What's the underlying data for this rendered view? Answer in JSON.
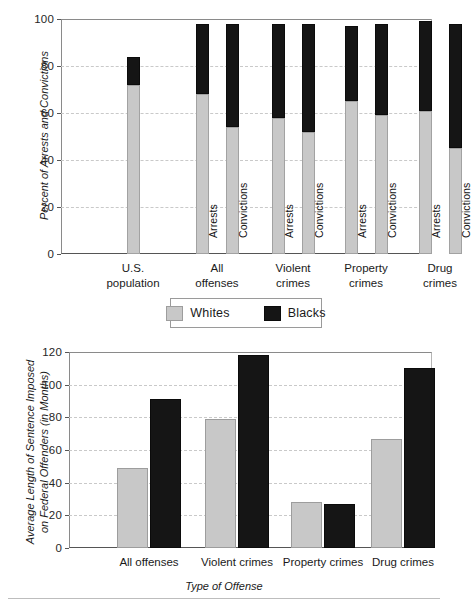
{
  "chart_data": [
    {
      "type": "bar",
      "subtype": "stacked-bar",
      "id": "arrests-convictions",
      "title": "",
      "xlabel": "",
      "ylabel": "Percent of Arrests and Convictions",
      "ylim": [
        0,
        100
      ],
      "yticks": [
        0,
        20,
        40,
        60,
        80,
        100
      ],
      "ytick_labels": [
        "0",
        "20",
        "40",
        "60",
        "80",
        "100"
      ],
      "grid": true,
      "legend": {
        "position": "below",
        "entries": [
          "Whites",
          "Blacks"
        ]
      },
      "series": [
        {
          "name": "Whites",
          "color": "#c8c8c8"
        },
        {
          "name": "Blacks",
          "color": "#151515"
        }
      ],
      "groups": [
        {
          "label": "U.S.\npopulation",
          "bars": [
            {
              "sublabel": "",
              "whites": 72,
              "blacks": 12,
              "total": 84
            }
          ]
        },
        {
          "label": "All\noffenses",
          "bars": [
            {
              "sublabel": "Arrests",
              "whites": 68,
              "blacks": 30,
              "total": 98
            },
            {
              "sublabel": "Convictions",
              "whites": 54,
              "blacks": 44,
              "total": 98
            }
          ]
        },
        {
          "label": "Violent\ncrimes",
          "bars": [
            {
              "sublabel": "Arrests",
              "whites": 58,
              "blacks": 40,
              "total": 98
            },
            {
              "sublabel": "Convictions",
              "whites": 52,
              "blacks": 46,
              "total": 98
            }
          ]
        },
        {
          "label": "Property\ncrimes",
          "bars": [
            {
              "sublabel": "Arrests",
              "whites": 65,
              "blacks": 32,
              "total": 97
            },
            {
              "sublabel": "Convictions",
              "whites": 59,
              "blacks": 39,
              "total": 98
            }
          ]
        },
        {
          "label": "Drug\ncrimes",
          "bars": [
            {
              "sublabel": "Arrests",
              "whites": 61,
              "blacks": 38,
              "total": 99
            },
            {
              "sublabel": "Convictions",
              "whites": 45,
              "blacks": 53,
              "total": 98
            }
          ]
        }
      ]
    },
    {
      "type": "bar",
      "subtype": "grouped-bar",
      "id": "sentence-length",
      "title": "",
      "xlabel": "Type of Offense",
      "ylabel": "Average Length of Sentence Imposed\non Federal Offenders (in Months)",
      "ylabel_line1": "Average Length of Sentence Imposed",
      "ylabel_line2": "on Federal Offenders (in Months)",
      "ylim": [
        0,
        120
      ],
      "yticks": [
        0,
        20,
        40,
        60,
        80,
        100,
        120
      ],
      "ytick_labels": [
        "0",
        "20",
        "40",
        "60",
        "80",
        "100",
        "120"
      ],
      "grid": true,
      "categories": [
        "All offenses",
        "Violent crimes",
        "Property crimes",
        "Drug crimes"
      ],
      "series": [
        {
          "name": "Whites",
          "color": "#c8c8c8",
          "values": [
            49,
            79,
            28,
            67
          ]
        },
        {
          "name": "Blacks",
          "color": "#151515",
          "values": [
            91,
            118,
            27,
            110
          ]
        }
      ]
    }
  ]
}
